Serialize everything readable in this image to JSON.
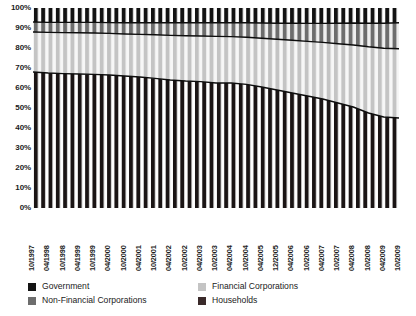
{
  "chart_data": {
    "type": "area",
    "title": "",
    "subtitle": "",
    "xlabel": "",
    "ylabel": "",
    "ylim": [
      0,
      100
    ],
    "grid": false,
    "stacked": true,
    "percent_stacked": true,
    "legend_position": "bottom",
    "ytick_labels": [
      "100%",
      "90%",
      "80%",
      "70%",
      "60%",
      "50%",
      "40%",
      "30%",
      "20%",
      "10%",
      "0%"
    ],
    "ytick_values": [
      100,
      90,
      80,
      70,
      60,
      50,
      40,
      30,
      20,
      10,
      0
    ],
    "categories": [
      "10/1997",
      "04/1998",
      "10/1998",
      "04/1999",
      "10/1999",
      "04/2000",
      "10/2000",
      "04/2001",
      "10/2001",
      "04/2002",
      "10/2002",
      "04/2003",
      "10/2003",
      "04/2004",
      "10/2004",
      "04/2005",
      "12/2005",
      "04/2006",
      "10/2006",
      "04/2007",
      "10/2007",
      "04/2008",
      "10/2008",
      "04/2009",
      "10/2009"
    ],
    "x": [
      "10/1997",
      "04/1998",
      "10/1998",
      "04/1999",
      "10/1999",
      "04/2000",
      "10/2000",
      "04/2001",
      "10/2001",
      "04/2002",
      "10/2002",
      "04/2003",
      "10/2003",
      "04/2004",
      "10/2004",
      "04/2005",
      "12/2005",
      "04/2006",
      "10/2006",
      "04/2007",
      "10/2007",
      "04/2008",
      "10/2008",
      "04/2009",
      "10/2009"
    ],
    "bars_per_category": 2,
    "total_bars": 50,
    "series": [
      {
        "name": "Households",
        "color": "#1c1c1c",
        "stack_order": 1,
        "values": [
          68.0,
          67.5,
          67.2,
          67.0,
          66.8,
          66.5,
          66.0,
          65.5,
          64.8,
          64.0,
          63.5,
          63.2,
          62.5,
          62.5,
          61.8,
          60.5,
          59.0,
          57.5,
          56.0,
          54.5,
          52.5,
          50.5,
          47.5,
          45.5,
          45.0
        ]
      },
      {
        "name": "Financial Corporations",
        "color": "#c9c9c9",
        "stack_order": 2,
        "values": [
          20.0,
          20.3,
          20.5,
          20.6,
          20.7,
          20.8,
          21.0,
          21.3,
          21.8,
          22.3,
          22.6,
          22.8,
          23.3,
          23.2,
          23.6,
          24.4,
          25.4,
          26.4,
          27.3,
          28.3,
          29.6,
          31.0,
          33.1,
          34.4,
          34.6
        ]
      },
      {
        "name": "Non-Financial Corporations",
        "color": "#6d6d6d",
        "stack_order": 3,
        "values": [
          5.0,
          5.0,
          5.1,
          5.2,
          5.3,
          5.4,
          5.6,
          5.8,
          6.0,
          6.3,
          6.5,
          6.6,
          6.8,
          7.0,
          7.2,
          7.6,
          8.0,
          8.5,
          9.0,
          9.5,
          10.3,
          11.0,
          11.8,
          12.5,
          13.0
        ]
      },
      {
        "name": "Government",
        "color": "#111111",
        "stack_order": 4,
        "values": [
          7.0,
          7.2,
          7.2,
          7.2,
          7.2,
          7.3,
          7.4,
          7.4,
          7.4,
          7.4,
          7.4,
          7.4,
          7.4,
          7.3,
          7.4,
          7.5,
          7.6,
          7.6,
          7.7,
          7.7,
          7.6,
          7.5,
          7.6,
          7.6,
          7.4
        ]
      }
    ],
    "boundaries": {
      "households_top": [
        68.0,
        67.5,
        67.2,
        67.0,
        66.8,
        66.5,
        66.0,
        65.5,
        64.8,
        64.0,
        63.5,
        63.2,
        62.5,
        62.5,
        61.8,
        60.5,
        59.0,
        57.5,
        56.0,
        54.5,
        52.5,
        50.5,
        47.5,
        45.5,
        45.0
      ],
      "financial_top": [
        88.0,
        87.8,
        87.7,
        87.6,
        87.5,
        87.3,
        87.0,
        86.8,
        86.6,
        86.3,
        86.1,
        86.0,
        85.8,
        85.7,
        85.4,
        84.9,
        84.4,
        83.9,
        83.3,
        82.8,
        82.1,
        81.5,
        80.6,
        79.9,
        79.6
      ],
      "nonfinancial_top": [
        93.0,
        92.8,
        92.8,
        92.8,
        92.8,
        92.7,
        92.6,
        92.6,
        92.6,
        92.6,
        92.6,
        92.6,
        92.6,
        92.7,
        92.6,
        92.5,
        92.4,
        92.4,
        92.3,
        92.3,
        92.4,
        92.5,
        92.4,
        92.4,
        92.6
      ]
    }
  },
  "legend": {
    "items": [
      {
        "label": "Government",
        "color": "#141414",
        "icon": "legend-swatch-icon"
      },
      {
        "label": "Non-Financial Corporations",
        "color": "#6d6d6d",
        "icon": "legend-swatch-icon"
      },
      {
        "label": "Financial Corporations",
        "color": "#c4c4c4",
        "icon": "legend-swatch-icon"
      },
      {
        "label": "Households",
        "color": "#3a2a2a",
        "icon": "legend-swatch-icon"
      }
    ]
  }
}
